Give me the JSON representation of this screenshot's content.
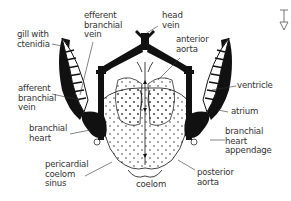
{
  "colors": {
    "ink": "#111111",
    "label": "#333333",
    "background": "#ffffff"
  },
  "labels": {
    "gill_with_ctenidia": "gill with\nctenidia",
    "efferent_branchial_vein": "efferent\nbranchial\nvein",
    "head_vein": "head\nvein",
    "anterior_aorta": "anterior\naorta",
    "afferent_branchial_vein": "afferent\nbranchial\nvein",
    "ventricle": "ventricle",
    "atrium": "atrium",
    "branchial_heart": "branchial\nheart",
    "branchial_heart_appendage": "branchial\nheart\nappendage",
    "pericardial_coelom_sinus": "pericardial\ncoelom\nsinus",
    "coelom": "coelom",
    "posterior_aorta": "posterior\naorta"
  },
  "orientation_icon": "anterior-posterior-orientation-icon"
}
